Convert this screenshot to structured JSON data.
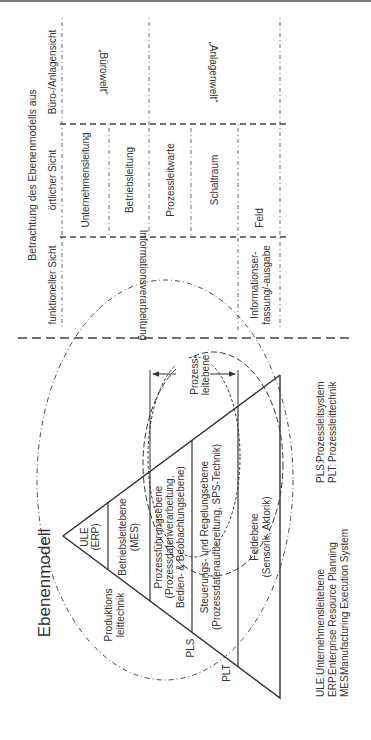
{
  "diagram": {
    "title": "Ebenenmodell",
    "orientation": "rotated 90° counter-clockwise",
    "pyramid_levels": [
      {
        "label": "ULE",
        "sub": "(ERP)"
      },
      {
        "label": "Betriebsleitebene",
        "sub": "(MES)"
      },
      {
        "label": "Prozessführungsebene",
        "sub": "(Prozessdatenverarbeitung,",
        "sub2": "Bedien- & Beobachtungsebene)"
      },
      {
        "label": "Steuerungs- und Regelungsebene",
        "sub": "(Prozessdatenaufbereitung, SPS-Technik)"
      },
      {
        "label": "Feldebene",
        "sub": "(Sensorik, Aktorik)"
      }
    ],
    "ellipse_labels": {
      "produktionsleittechnik_1": "Produktions",
      "produktionsleittechnik_2": "leittechnik",
      "pls": "PLS",
      "plt": "PLT"
    },
    "prozessleitebene_1": "Prozess-",
    "prozessleitebene_2": "leitebene",
    "legend_left": [
      {
        "abbr": "ULE:",
        "text": "Unternehmensleitebene"
      },
      {
        "abbr": "ERP:",
        "text": "Enterprise Resource Planning"
      },
      {
        "abbr": "MES:",
        "text": "Manufacturing Execution System"
      }
    ],
    "legend_right": [
      {
        "abbr": "PLS:",
        "text": "Prozessleitsystem"
      },
      {
        "abbr": "PLT:",
        "text": "Prozessleittechnik"
      }
    ]
  },
  "table": {
    "header": "Betrachtung des Ebenenmodells aus",
    "columns": [
      "funktioneller Sicht",
      "örtlicher Sicht",
      "Büro-/Anlagensicht"
    ],
    "funktionell": [
      "Informationsverarbeitung",
      "Informationser-",
      "fassung/-ausgabe"
    ],
    "oertlich": [
      "Unternehmensleitung",
      "Betriebsleitung",
      "Prozessleitwarte",
      "Schaltraum",
      "Feld"
    ],
    "buero": [
      "„Bürowelt“",
      "„Anlagenwelt“"
    ]
  },
  "colors": {
    "line": "#333333",
    "text": "#333333",
    "background": "#ffffff"
  }
}
